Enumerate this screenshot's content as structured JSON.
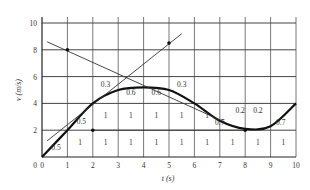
{
  "chart_data": {
    "type": "line",
    "title": "",
    "xlabel": "t (s)",
    "ylabel": "v (m/s)",
    "xlim": [
      0,
      10
    ],
    "ylim": [
      0,
      10
    ],
    "grid": true,
    "x_ticks": [
      "0",
      "1",
      "2",
      "3",
      "4",
      "5",
      "6",
      "7",
      "8",
      "9",
      "10"
    ],
    "y_ticks": [
      "2",
      "4",
      "6",
      "8",
      "10"
    ],
    "series": [
      {
        "name": "velocity curve",
        "style": "thick",
        "x": [
          0,
          1,
          2,
          3,
          4,
          5,
          6,
          7,
          8,
          9,
          10
        ],
        "y": [
          0,
          2,
          4,
          5,
          5.2,
          5,
          4,
          2.7,
          2.1,
          2.3,
          4
        ]
      },
      {
        "name": "tangent (increasing)",
        "style": "thin",
        "x": [
          0.2,
          5.5
        ],
        "y": [
          1.2,
          9.2
        ]
      },
      {
        "name": "tangent (decreasing)",
        "style": "thin",
        "x": [
          0.2,
          7.2
        ],
        "y": [
          8.6,
          2.6
        ]
      },
      {
        "name": "horizontal reference",
        "style": "thin",
        "x": [
          2,
          8
        ],
        "y": [
          2,
          2
        ]
      }
    ],
    "points": [
      {
        "x": 1,
        "y": 8
      },
      {
        "x": 5,
        "y": 8.5
      },
      {
        "x": 2,
        "y": 2
      },
      {
        "x": 8,
        "y": 2
      }
    ],
    "annotations": [
      {
        "text": "0.5",
        "x": 0.55,
        "y": 0.5
      },
      {
        "text": "1",
        "x": 1.5,
        "y": 0.9
      },
      {
        "text": "1",
        "x": 2.5,
        "y": 0.9
      },
      {
        "text": "1",
        "x": 3.5,
        "y": 0.9
      },
      {
        "text": "1",
        "x": 4.5,
        "y": 0.9
      },
      {
        "text": "1",
        "x": 5.5,
        "y": 0.9
      },
      {
        "text": "1",
        "x": 6.5,
        "y": 0.9
      },
      {
        "text": "1",
        "x": 7.5,
        "y": 0.9
      },
      {
        "text": "1",
        "x": 8.5,
        "y": 0.9
      },
      {
        "text": "1",
        "x": 9.5,
        "y": 0.9
      },
      {
        "text": "0.5",
        "x": 1.55,
        "y": 2.5
      },
      {
        "text": "1",
        "x": 2.5,
        "y": 2.9
      },
      {
        "text": "1",
        "x": 3.5,
        "y": 2.9
      },
      {
        "text": "1",
        "x": 4.5,
        "y": 2.9
      },
      {
        "text": "1",
        "x": 5.5,
        "y": 2.9
      },
      {
        "text": "1",
        "x": 6.5,
        "y": 2.9
      },
      {
        "text": "0.7",
        "x": 7.0,
        "y": 2.4
      },
      {
        "text": "0.2",
        "x": 7.8,
        "y": 3.3
      },
      {
        "text": "0.2",
        "x": 8.5,
        "y": 3.3
      },
      {
        "text": "0.7",
        "x": 9.4,
        "y": 2.4
      },
      {
        "text": "0.3",
        "x": 2.5,
        "y": 5.2
      },
      {
        "text": "0.6",
        "x": 3.5,
        "y": 4.6
      },
      {
        "text": "0.6",
        "x": 4.5,
        "y": 4.6
      },
      {
        "text": "0.3",
        "x": 5.5,
        "y": 5.2
      }
    ]
  }
}
